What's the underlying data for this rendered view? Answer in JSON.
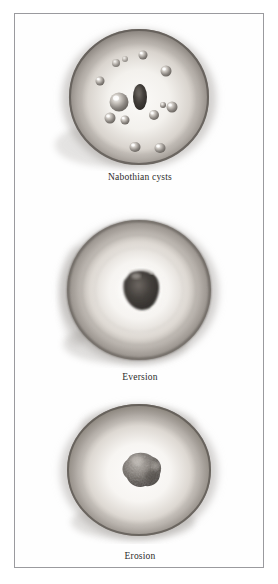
{
  "figure": {
    "type": "medical-illustration-plate",
    "orientation": "vertical",
    "panel_count": 3,
    "medium": "grayscale airbrush drawing",
    "frame": {
      "border_color": "#9a9a9e",
      "border_width_px": 1,
      "background": "#ffffff"
    }
  },
  "palette": {
    "page_background": "#ffffff",
    "frame_border": "#9a9a9e",
    "caption_text": "#2b2b2b",
    "cervix_rim_dark": "#6f6a66",
    "cervix_rim_mid": "#9b9692",
    "cervix_face_light": "#f4f2ef",
    "cervix_face_mid": "#cfcac4",
    "os_dark": "#3a3734",
    "lesion_dark": "#55504b",
    "cyst_highlight": "#ffffff",
    "cyst_body": "#8e8984"
  },
  "panels": [
    {
      "id": "nabothian-cysts",
      "caption": "Nabothian cysts",
      "description": "Cervix with multiple small translucent retention cysts scattered over the ectocervix around a slit-like external os",
      "os": {
        "shape": "vertical-slit",
        "cx": 125,
        "cy": 78,
        "rx": 7,
        "ry": 13
      },
      "cysts": [
        {
          "cx": 104,
          "cy": 83,
          "r": 9.5
        },
        {
          "cx": 95,
          "cy": 99,
          "r": 5.5
        },
        {
          "cx": 110,
          "cy": 101,
          "r": 4.5
        },
        {
          "cx": 139,
          "cy": 96,
          "r": 5.0
        },
        {
          "cx": 148,
          "cy": 86,
          "r": 3.0
        },
        {
          "cx": 157,
          "cy": 88,
          "r": 5.5
        },
        {
          "cx": 85,
          "cy": 62,
          "r": 4.5
        },
        {
          "cx": 101,
          "cy": 44,
          "r": 4.0
        },
        {
          "cx": 110,
          "cy": 40,
          "r": 3.0
        },
        {
          "cx": 128,
          "cy": 36,
          "r": 4.5
        },
        {
          "cx": 151,
          "cy": 52,
          "r": 5.5
        },
        {
          "cx": 120,
          "cy": 128,
          "r": 5.5
        },
        {
          "cx": 145,
          "cy": 129,
          "r": 5.5
        }
      ]
    },
    {
      "id": "eversion",
      "caption": "Eversion",
      "description": "Cervix showing eversion: a broad irregular dark central opening surrounded by a pale everted columnar epithelium rim",
      "os": {
        "shape": "irregular-wide",
        "cx": 125,
        "cy": 80,
        "rx": 17,
        "ry": 18
      }
    },
    {
      "id": "erosion",
      "caption": "Erosion",
      "description": "Cervix showing a small granular textured erosion lesion at the external os",
      "os": {
        "shape": "granular-lesion",
        "cx": 125,
        "cy": 74,
        "rx": 14,
        "ry": 14
      }
    }
  ]
}
